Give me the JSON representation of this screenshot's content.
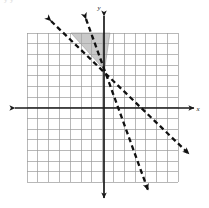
{
  "figure": {
    "kind": "coordinate-plane-graph",
    "width": 209,
    "height": 208,
    "background_color": "#ffffff",
    "header_ghost_text": "y  y",
    "axis_labels": {
      "x": "x",
      "y": "y"
    },
    "colors": {
      "grid_line": "#9a9a9a",
      "axis": "#1a1a1a",
      "dashed_line": "#111111",
      "shaded_region": "#a8a8a8",
      "shaded_region_edge": "#8e8e8e",
      "label": "#1a1a1a"
    },
    "grid": {
      "left": 27,
      "top": 33,
      "right": 178,
      "bottom": 182,
      "cell_size": 10.8,
      "columns": 14,
      "rows": 14,
      "visible": true
    },
    "axes": {
      "origin_px": [
        104,
        108
      ],
      "x_axis": {
        "y_px": 108,
        "x_start_px": 13,
        "x_end_px": 196,
        "arrow_start": true,
        "arrow_end": true,
        "label": "x",
        "label_px": [
          199,
          110
        ]
      },
      "y_axis": {
        "x_px": 104,
        "y_start_px": 14,
        "y_end_px": 200,
        "arrow_start": true,
        "arrow_end": true,
        "label": "y",
        "label_px": [
          100,
          9
        ]
      }
    },
    "lines": [
      {
        "name": "shallow-dashed-boundary",
        "style": "dashed",
        "arrow_start": true,
        "arrow_end": true,
        "start_px": [
          49,
          19
        ],
        "end_px": [
          191,
          156
        ],
        "slope_px": -0.965,
        "y_intercept_grid": 3.5,
        "slope_grid": -1.0,
        "description": "dashed line with slope about -1 crossing y-axis above origin"
      },
      {
        "name": "steep-dashed-boundary",
        "style": "dashed",
        "arrow_start": true,
        "arrow_end": true,
        "start_px": [
          85,
          17
        ],
        "end_px": [
          149,
          193
        ],
        "slope_px": -2.75,
        "y_intercept_grid": 3.5,
        "slope_grid": -2.75,
        "description": "steeper dashed line crossing y-axis above origin and exiting bottom"
      }
    ],
    "intersection_px": [
      104,
      70
    ],
    "shaded_region": {
      "name": "solution-region",
      "shape": "triangle",
      "fill": "#a8a8a8",
      "opacity": 0.62,
      "vertices_px": [
        [
          71,
          33
        ],
        [
          110,
          33
        ],
        [
          104,
          70
        ]
      ],
      "description": "gray shaded wedge between the two dashed boundary lines above their intersection"
    },
    "dash_pattern": "5 3.4",
    "dash_width": 2.3
  }
}
